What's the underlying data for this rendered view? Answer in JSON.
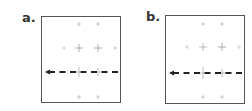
{
  "figure": {
    "panels": [
      {
        "label": "a.",
        "frame": {
          "x": 41,
          "y": 16,
          "w": 80,
          "h": 87
        },
        "crosses": [
          {
            "x": 79,
            "y": 24,
            "size": 2,
            "color": "#bbbbbb"
          },
          {
            "x": 98,
            "y": 24,
            "size": 2,
            "color": "#bbbbbb"
          },
          {
            "x": 64,
            "y": 48,
            "size": 2,
            "color": "#cccccc"
          },
          {
            "x": 79,
            "y": 48,
            "size": 4,
            "color": "#999999"
          },
          {
            "x": 98,
            "y": 48,
            "size": 4,
            "color": "#999999"
          },
          {
            "x": 115,
            "y": 48,
            "size": 2,
            "color": "#cccccc"
          },
          {
            "x": 79,
            "y": 72,
            "size": 5,
            "color": "#aaaaaa"
          },
          {
            "x": 98,
            "y": 72,
            "size": 4,
            "color": "#aaaaaa"
          },
          {
            "x": 79,
            "y": 97,
            "size": 2,
            "color": "#bbbbbb"
          },
          {
            "x": 98,
            "y": 97,
            "size": 2,
            "color": "#bbbbbb"
          }
        ],
        "dashed_line": {
          "y": 72,
          "x_start": 45,
          "x_end": 119,
          "color": "#222222"
        },
        "arrow": {
          "x": 45,
          "y": 72,
          "direction": "left"
        }
      },
      {
        "label": "b.",
        "frame": {
          "x": 165,
          "y": 15,
          "w": 80,
          "h": 89
        },
        "crosses": [
          {
            "x": 203,
            "y": 24,
            "size": 2,
            "color": "#bbbbbb"
          },
          {
            "x": 222,
            "y": 24,
            "size": 2,
            "color": "#bbbbbb"
          },
          {
            "x": 187,
            "y": 47,
            "size": 2,
            "color": "#cccccc"
          },
          {
            "x": 203,
            "y": 47,
            "size": 4,
            "color": "#aaaaaa"
          },
          {
            "x": 222,
            "y": 47,
            "size": 4,
            "color": "#999999"
          },
          {
            "x": 239,
            "y": 47,
            "size": 2,
            "color": "#cccccc"
          },
          {
            "x": 203,
            "y": 73,
            "size": 6,
            "color": "#aaaaaa"
          },
          {
            "x": 222,
            "y": 73,
            "size": 4,
            "color": "#aaaaaa"
          },
          {
            "x": 203,
            "y": 97,
            "size": 2,
            "color": "#bbbbbb"
          },
          {
            "x": 222,
            "y": 97,
            "size": 2,
            "color": "#bbbbbb"
          }
        ],
        "dashed_line": {
          "y": 73,
          "x_start": 169,
          "x_end": 243,
          "color": "#222222"
        },
        "arrow": {
          "x": 169,
          "y": 73,
          "direction": "left"
        }
      }
    ]
  }
}
